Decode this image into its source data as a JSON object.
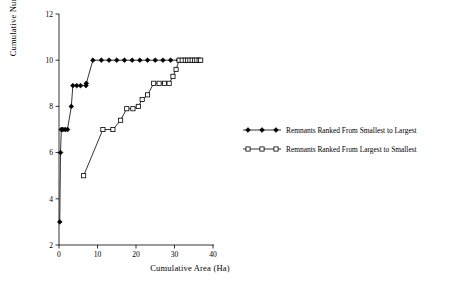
{
  "chart_data": {
    "type": "line",
    "title": "",
    "xlabel": "Cumulative Area (Ha)",
    "ylabel": "Cumulative Number of Species",
    "xlim": [
      0,
      40
    ],
    "ylim": [
      2,
      12
    ],
    "xticks": [
      0,
      10,
      20,
      30,
      40
    ],
    "yticks": [
      2,
      4,
      6,
      8,
      10,
      12
    ],
    "grid": false,
    "legend_position": "right-middle",
    "series": [
      {
        "name": "Remnants Ranked From Smallest to Largest",
        "marker": "filled-diamond",
        "points": [
          [
            0.2,
            3.0
          ],
          [
            0.4,
            6.0
          ],
          [
            0.6,
            7.0
          ],
          [
            1.0,
            7.0
          ],
          [
            1.6,
            7.0
          ],
          [
            2.2,
            7.0
          ],
          [
            3.2,
            8.0
          ],
          [
            3.6,
            8.9
          ],
          [
            4.6,
            8.9
          ],
          [
            5.6,
            8.9
          ],
          [
            7.0,
            8.9
          ],
          [
            7.1,
            9.0
          ],
          [
            8.8,
            10.0
          ],
          [
            11.0,
            10.0
          ],
          [
            13.0,
            10.0
          ],
          [
            15.0,
            10.0
          ],
          [
            17.0,
            10.0
          ],
          [
            19.0,
            10.0
          ],
          [
            21.0,
            10.0
          ],
          [
            23.0,
            10.0
          ],
          [
            25.0,
            10.0
          ],
          [
            27.0,
            10.0
          ],
          [
            29.0,
            10.0
          ],
          [
            31.0,
            10.0
          ],
          [
            32.0,
            10.0
          ],
          [
            33.0,
            10.0
          ],
          [
            34.0,
            10.0
          ],
          [
            35.0,
            10.0
          ],
          [
            36.0,
            10.0
          ],
          [
            36.6,
            10.0
          ]
        ]
      },
      {
        "name": "Remnants Ranked From Largest to Smallest",
        "marker": "open-square",
        "points": [
          [
            6.4,
            5.0
          ],
          [
            11.4,
            7.0
          ],
          [
            14.0,
            7.0
          ],
          [
            16.0,
            7.4
          ],
          [
            17.6,
            7.9
          ],
          [
            19.2,
            7.9
          ],
          [
            20.6,
            8.0
          ],
          [
            21.6,
            8.3
          ],
          [
            23.0,
            8.5
          ],
          [
            24.6,
            9.0
          ],
          [
            26.0,
            9.0
          ],
          [
            27.4,
            9.0
          ],
          [
            28.6,
            9.0
          ],
          [
            29.6,
            9.3
          ],
          [
            30.4,
            9.6
          ],
          [
            31.2,
            10.0
          ],
          [
            32.0,
            10.0
          ],
          [
            32.8,
            10.0
          ],
          [
            33.4,
            10.0
          ],
          [
            34.0,
            10.0
          ],
          [
            34.6,
            10.0
          ],
          [
            35.2,
            10.0
          ],
          [
            35.8,
            10.0
          ],
          [
            36.4,
            10.0
          ],
          [
            36.8,
            10.0
          ]
        ]
      }
    ]
  },
  "legend": {
    "entries": [
      {
        "label": "Remnants Ranked From Smallest to Largest"
      },
      {
        "label": "Remnants Ranked From Largest to Smallest"
      }
    ]
  }
}
